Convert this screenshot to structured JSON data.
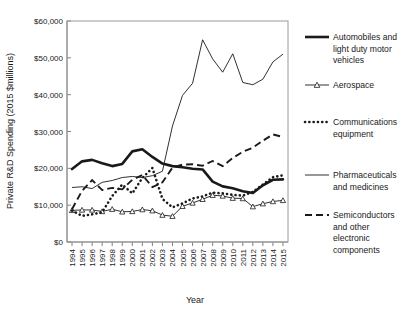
{
  "chart_data": {
    "type": "line",
    "title": "",
    "xlabel": "Year",
    "ylabel": "Private R&D Spending (2015 $millions)",
    "x": [
      1994,
      1995,
      1996,
      1997,
      1998,
      1999,
      2000,
      2001,
      2002,
      2003,
      2004,
      2005,
      2006,
      2007,
      2008,
      2009,
      2010,
      2011,
      2012,
      2013,
      2014,
      2015
    ],
    "xtick_labels": [
      "1994",
      "1995",
      "1996",
      "1997",
      "1998",
      "1999",
      "2000",
      "2001",
      "2002",
      "2003",
      "2004",
      "2005",
      "2006",
      "2007",
      "2008",
      "2009",
      "2010",
      "2011",
      "2012",
      "2013",
      "2014",
      "2015"
    ],
    "ylim": [
      0,
      60000
    ],
    "ytick_values": [
      0,
      10000,
      20000,
      30000,
      40000,
      50000,
      60000
    ],
    "ytick_labels": [
      "$0",
      "$10,000",
      "$20,000",
      "$30,000",
      "$40,000",
      "$50,000",
      "$60,000"
    ],
    "grid": false,
    "legend_position": "right",
    "series": [
      {
        "name": "Automobiles and light duty motor vehicles",
        "style": "thick-solid",
        "marker": "none",
        "values": [
          19800,
          21900,
          22300,
          21400,
          20600,
          21200,
          24600,
          25200,
          23100,
          21300,
          20600,
          20300,
          19900,
          19700,
          16400,
          15100,
          14600,
          13800,
          13300,
          15400,
          16900,
          17000
        ]
      },
      {
        "name": "Aerospace",
        "style": "thin-solid",
        "marker": "triangle",
        "values": [
          8600,
          8700,
          8700,
          8300,
          8900,
          8200,
          8300,
          8800,
          8500,
          7300,
          7000,
          9700,
          10600,
          11600,
          12700,
          12500,
          11900,
          11800,
          9600,
          10400,
          11000,
          11300
        ]
      },
      {
        "name": "Communications equipment",
        "style": "dotted",
        "marker": "none",
        "values": [
          8500,
          7100,
          7500,
          8100,
          12500,
          15600,
          13200,
          17400,
          20100,
          11700,
          9400,
          10500,
          11800,
          12400,
          13400,
          13200,
          12800,
          12600,
          13600,
          15600,
          17600,
          18100
        ]
      },
      {
        "name": "Pharmaceuticals and medicines",
        "style": "thin-solid",
        "marker": "none",
        "values": [
          14800,
          15000,
          14500,
          16200,
          16700,
          17500,
          17800,
          17500,
          18000,
          19200,
          31500,
          39800,
          43100,
          54900,
          49700,
          46100,
          51100,
          43300,
          42700,
          44200,
          48900,
          51000
        ]
      },
      {
        "name": "Semiconductors and other electronic components",
        "style": "dashed",
        "marker": "none",
        "values": [
          8900,
          13900,
          16800,
          14100,
          14700,
          14300,
          16900,
          18200,
          14900,
          16200,
          20200,
          21000,
          21100,
          20700,
          22000,
          20600,
          22800,
          24500,
          25600,
          27500,
          29200,
          28500
        ]
      }
    ]
  },
  "legend": {
    "entries": [
      {
        "label_line1": "Automobiles and",
        "label_line2": "light duty motor",
        "label_line3": "vehicles",
        "swatch": "thick-solid-swatch"
      },
      {
        "label_line1": "Aerospace",
        "label_line2": "",
        "label_line3": "",
        "swatch": "thin-solid-triangle-swatch"
      },
      {
        "label_line1": "Communications",
        "label_line2": "equipment",
        "label_line3": "",
        "swatch": "dotted-swatch"
      },
      {
        "label_line1": "Pharmaceuticals",
        "label_line2": "and medicines",
        "label_line3": "",
        "swatch": "thin-solid-swatch"
      },
      {
        "label_line1": "Semiconductors",
        "label_line2": "and other",
        "label_line3": "electronic",
        "label_line4": "components",
        "swatch": "dashed-swatch"
      }
    ]
  },
  "colors": {
    "ink": "#1a1a1a",
    "axis": "#808080",
    "frame": "#9a9a9a",
    "background": "#ffffff"
  }
}
